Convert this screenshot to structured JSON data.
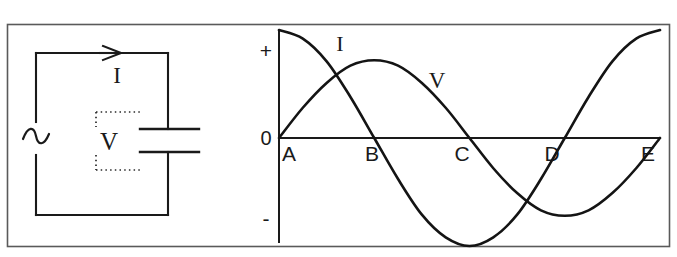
{
  "figure": {
    "type": "physics-diagram",
    "border_color": "#3a3a3a",
    "line_color": "#1a1a1a",
    "background": "#ffffff"
  },
  "top_sliver": {
    "left_fragment": "",
    "right_fragment": ""
  },
  "circuit": {
    "source_symbol": "~",
    "source_name": "ac-source",
    "current_label": "I",
    "voltage_label": "V",
    "component": "capacitor",
    "arrow_direction": "right"
  },
  "chart_data": {
    "type": "line",
    "title": "",
    "xlabel": "",
    "ylabel": "",
    "grid": false,
    "legend": "inline-labels",
    "ylim": [
      -1,
      1
    ],
    "xlim": [
      0,
      4
    ],
    "y_tick_labels": [
      "+",
      "0",
      "-"
    ],
    "y_tick_values": [
      1,
      0,
      -1
    ],
    "x_tick_labels": [
      "A",
      "B",
      "C",
      "D",
      "E"
    ],
    "x_tick_values": [
      0,
      1,
      2,
      3,
      4
    ],
    "series": [
      {
        "name": "I",
        "label": "I",
        "waveform": "cosine",
        "phase_deg": 90,
        "amplitude": 1.0,
        "description": "current leads voltage by 90 degrees",
        "x": [
          0,
          0.25,
          0.5,
          0.75,
          1,
          1.25,
          1.5,
          1.75,
          2,
          2.25,
          2.5,
          2.75,
          3,
          3.25,
          3.5,
          3.75,
          4
        ],
        "values": [
          1,
          0.92,
          0.71,
          0.38,
          0,
          -0.38,
          -0.71,
          -0.92,
          -1,
          -0.92,
          -0.71,
          -0.38,
          0,
          0.38,
          0.71,
          0.92,
          1
        ]
      },
      {
        "name": "V",
        "label": "V",
        "waveform": "sine",
        "phase_deg": 0,
        "amplitude": 0.72,
        "description": "voltage across the capacitor lags the current",
        "x": [
          0,
          0.25,
          0.5,
          0.75,
          1,
          1.25,
          1.5,
          1.75,
          2,
          2.25,
          2.5,
          2.75,
          3,
          3.25,
          3.5,
          3.75,
          4
        ],
        "values": [
          0,
          0.28,
          0.51,
          0.67,
          0.72,
          0.67,
          0.51,
          0.28,
          0,
          -0.28,
          -0.51,
          -0.67,
          -0.72,
          -0.67,
          -0.51,
          -0.28,
          0
        ]
      }
    ],
    "annotations": [
      {
        "text": "I",
        "x": 0.72,
        "y": 0.92
      },
      {
        "text": "V",
        "x": 1.83,
        "y": 0.76
      }
    ]
  }
}
